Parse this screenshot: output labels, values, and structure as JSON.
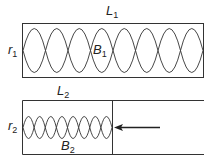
{
  "diagram": {
    "top": {
      "length_label": "L",
      "length_sub": "1",
      "radius_label": "r",
      "radius_sub": "1",
      "beam_label": "B",
      "beam_sub": "1",
      "lobe_count": 8
    },
    "bottom": {
      "length_label": "L",
      "length_sub": "2",
      "radius_label": "r",
      "radius_sub": "2",
      "beam_label": "B",
      "beam_sub": "2",
      "lobe_count": 8,
      "arrow": "left-pointing arrow indicating piston pushed inward"
    },
    "colors": {
      "stroke": "#333333",
      "background": "#ffffff"
    }
  }
}
